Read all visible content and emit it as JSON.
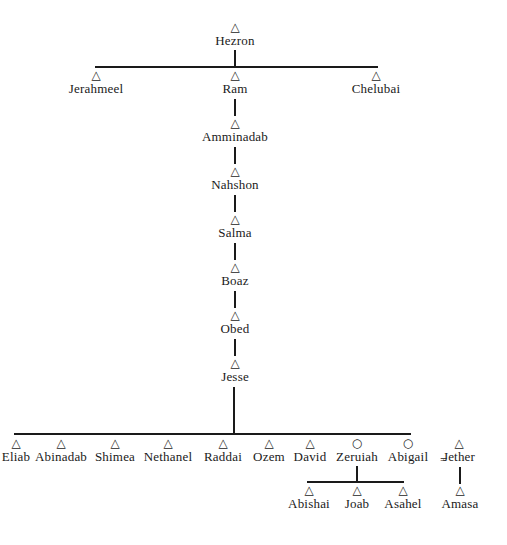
{
  "diagram": {
    "type": "genealogy",
    "symbols": {
      "male": "△",
      "female": "○",
      "marriage": "="
    },
    "root": {
      "name": "Hezron",
      "sex": "male"
    },
    "generation2": [
      {
        "name": "Jerahmeel",
        "sex": "male"
      },
      {
        "name": "Ram",
        "sex": "male"
      },
      {
        "name": "Chelubai",
        "sex": "male"
      }
    ],
    "lineage": [
      {
        "name": "Amminadab",
        "sex": "male"
      },
      {
        "name": "Nahshon",
        "sex": "male"
      },
      {
        "name": "Salma",
        "sex": "male"
      },
      {
        "name": "Boaz",
        "sex": "male"
      },
      {
        "name": "Obed",
        "sex": "male"
      },
      {
        "name": "Jesse",
        "sex": "male"
      }
    ],
    "children_of_jesse": [
      {
        "name": "Eliab",
        "sex": "male",
        "visible_text": "Eliab"
      },
      {
        "name": "Abinadab",
        "sex": "male"
      },
      {
        "name": "Shimea",
        "sex": "male"
      },
      {
        "name": "Nethanel",
        "sex": "male"
      },
      {
        "name": "Raddai",
        "sex": "male"
      },
      {
        "name": "Ozem",
        "sex": "male"
      },
      {
        "name": "David",
        "sex": "male"
      },
      {
        "name": "Zeruiah",
        "sex": "female"
      },
      {
        "name": "Abigail",
        "sex": "female"
      }
    ],
    "spouse": {
      "name": "Jether",
      "sex": "male",
      "married_to": "Abigail"
    },
    "children_of_zeruiah": [
      {
        "name": "Abishai",
        "sex": "male"
      },
      {
        "name": "Joab",
        "sex": "male"
      },
      {
        "name": "Asahel",
        "sex": "male"
      }
    ],
    "children_of_abigail": [
      {
        "name": "Amasa",
        "sex": "male"
      }
    ]
  }
}
